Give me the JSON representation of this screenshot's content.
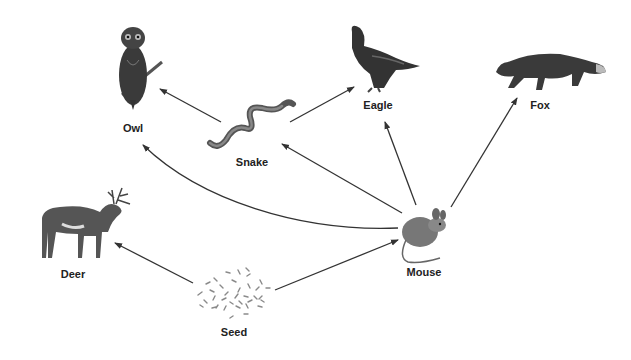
{
  "colors": {
    "arrow": "#333333",
    "animal": "#3a3a3a",
    "animal_light": "#6a6a6a",
    "seed": "#8a8a8a",
    "label": "#222222"
  },
  "organisms": [
    {
      "id": "owl",
      "label": "Owl",
      "x": 133,
      "y": 130
    },
    {
      "id": "snake",
      "label": "Snake",
      "x": 252,
      "y": 164
    },
    {
      "id": "eagle",
      "label": "Eagle",
      "x": 378,
      "y": 107
    },
    {
      "id": "fox",
      "label": "Fox",
      "x": 540,
      "y": 107
    },
    {
      "id": "deer",
      "label": "Deer",
      "x": 73,
      "y": 276
    },
    {
      "id": "seed",
      "label": "Seed",
      "x": 234,
      "y": 334
    },
    {
      "id": "mouse",
      "label": "Mouse",
      "x": 424,
      "y": 274
    }
  ],
  "arrows": [
    {
      "from": "snake",
      "to": "owl"
    },
    {
      "from": "snake",
      "to": "eagle"
    },
    {
      "from": "mouse",
      "to": "owl"
    },
    {
      "from": "mouse",
      "to": "snake"
    },
    {
      "from": "mouse",
      "to": "eagle"
    },
    {
      "from": "mouse",
      "to": "fox"
    },
    {
      "from": "seed",
      "to": "deer"
    },
    {
      "from": "seed",
      "to": "mouse"
    }
  ]
}
